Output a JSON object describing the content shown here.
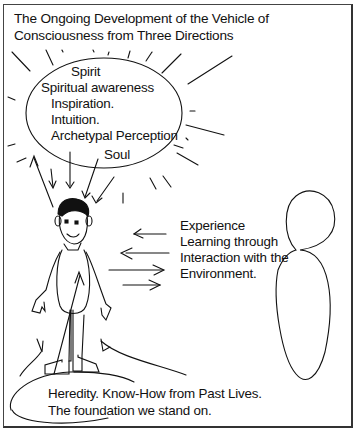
{
  "title": {
    "line1": "The Ongoing Development of the Vehicle of",
    "line2": "Consciousness from Three Directions"
  },
  "spirit_circle": {
    "heading": "Spirit",
    "items": [
      "Spiritual awareness",
      "Inspiration.",
      "Intuition.",
      "Archetypal Perception"
    ],
    "soul_label": "Soul"
  },
  "environment": {
    "lines": [
      "Experience",
      "Learning through",
      "Interaction with the",
      "Environment."
    ]
  },
  "heredity": {
    "line1": "Heredity. Know-How from Past Lives.",
    "line2": "The foundation we stand on."
  },
  "colors": {
    "stroke": "#111111",
    "background": "#ffffff",
    "frame": "#444444"
  }
}
